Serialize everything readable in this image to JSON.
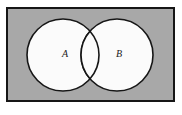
{
  "figure": {
    "kind": "venn-diagram",
    "canvas": {
      "width": 182,
      "height": 115,
      "background": "#ffffff"
    }
  },
  "universal_set": {
    "name": "universal-set-rectangle",
    "fill": "#a8a8a8",
    "stroke": "#161616",
    "stroke_width": 2,
    "x": 7,
    "y": 8,
    "width": 167,
    "height": 93
  },
  "sets": [
    {
      "id": "A",
      "label": "A",
      "fill": "#fbfbfb",
      "stroke": "#161616",
      "stroke_width": 1.6,
      "cx": 63,
      "cy": 55,
      "r": 36,
      "label_x": 65,
      "label_y": 55
    },
    {
      "id": "B",
      "label": "B",
      "fill": "#fbfbfb",
      "stroke": "#161616",
      "stroke_width": 1.6,
      "cx": 117,
      "cy": 55,
      "r": 36,
      "label_x": 119,
      "label_y": 55
    }
  ],
  "regions": {
    "intersection_label": "",
    "outside_label": ""
  }
}
